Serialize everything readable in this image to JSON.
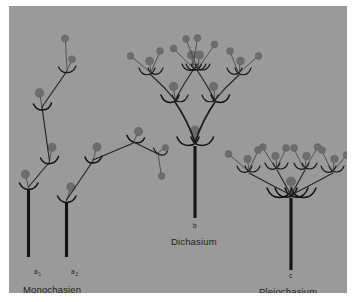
{
  "figure": {
    "title_implied": "Cymose inflorescence types",
    "background_color": "#9a9a9a",
    "page_color": "#fdfdfd",
    "ink_color": "#141414",
    "bud_color": "#6d6d6d",
    "panel": {
      "x": 9,
      "y": 6,
      "width": 338,
      "height": 287
    },
    "labels": [
      {
        "id": "a1",
        "key": "a",
        "sub": "1",
        "x": 25,
        "y": 268,
        "name": ""
      },
      {
        "id": "a2",
        "key": "a",
        "sub": "2",
        "x": 62,
        "y": 268,
        "name": ""
      },
      {
        "id": "monochasien",
        "key": "",
        "sub": "",
        "x": 14,
        "y": 287,
        "name": "Monochasien"
      },
      {
        "id": "b",
        "key": "b",
        "sub": "",
        "x": 186,
        "y": 222,
        "name": ""
      },
      {
        "id": "dichasium",
        "key": "",
        "sub": "",
        "x": 162,
        "y": 239,
        "name": "Dichasium"
      },
      {
        "id": "c",
        "key": "c",
        "sub": "",
        "x": 282,
        "y": 272,
        "name": ""
      },
      {
        "id": "pleiochasium",
        "key": "",
        "sub": "",
        "x": 250,
        "y": 289,
        "name": "Pleiochasium"
      }
    ],
    "specimens": [
      {
        "id": "a1",
        "type": "monochasium",
        "label": "a",
        "subscript": "1",
        "description": "Monochasium with zigzag sympodial axis, buds alternating up-left"
      },
      {
        "id": "a2",
        "type": "monochasium",
        "label": "a",
        "subscript": "2",
        "description": "Monochasium with sympodial axis zigzagging to the right"
      },
      {
        "id": "b",
        "type": "dichasium",
        "label": "b",
        "subscript": "",
        "description": "Dichasium: repeated symmetric two-branched cyme, three orders"
      },
      {
        "id": "c",
        "type": "pleiochasium",
        "label": "c",
        "subscript": "",
        "description": "Pleiochasium: four lateral branches in one whorl from a terminal flower"
      }
    ]
  }
}
